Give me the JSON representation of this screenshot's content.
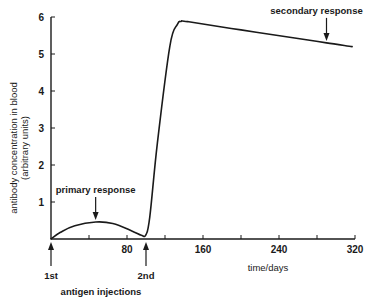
{
  "chart_data": {
    "type": "line",
    "title": "",
    "xlabel": "time/days",
    "ylabel": "antibody concentration in blood",
    "ylabel_sub": "(arbitrary units)",
    "xlim": [
      0,
      320
    ],
    "ylim": [
      0,
      6
    ],
    "x_ticks": [
      0,
      40,
      80,
      120,
      160,
      200,
      240,
      280,
      320
    ],
    "x_tick_labels": [
      "",
      "",
      "80",
      "",
      "160",
      "",
      "240",
      "",
      "320"
    ],
    "y_ticks": [
      0,
      1,
      2,
      3,
      4,
      5,
      6
    ],
    "y_tick_labels": [
      "",
      "1",
      "2",
      "3",
      "4",
      "5",
      "6"
    ],
    "grid": false,
    "series": [
      {
        "name": "antibody concentration",
        "x": [
          0,
          10,
          25,
          47,
          65,
          85,
          95,
          100,
          104,
          112,
          125,
          133,
          137,
          145,
          200,
          260,
          290,
          317
        ],
        "y": [
          0,
          0.18,
          0.36,
          0.46,
          0.42,
          0.22,
          0.1,
          0.12,
          0.6,
          2.6,
          5.2,
          5.8,
          5.88,
          5.87,
          5.65,
          5.42,
          5.3,
          5.2
        ]
      }
    ],
    "annotations": [
      {
        "text": "primary response",
        "x": 47,
        "y": 0.46,
        "arrow": "down"
      },
      {
        "text": "secondary response",
        "x": 290,
        "y": 5.3,
        "arrow": "down"
      },
      {
        "text": "1st",
        "x": 0,
        "arrow": "up",
        "group": "antigen injections"
      },
      {
        "text": "2nd",
        "x": 100,
        "arrow": "up",
        "group": "antigen injections"
      }
    ],
    "injection_group_label": "antigen injections"
  }
}
